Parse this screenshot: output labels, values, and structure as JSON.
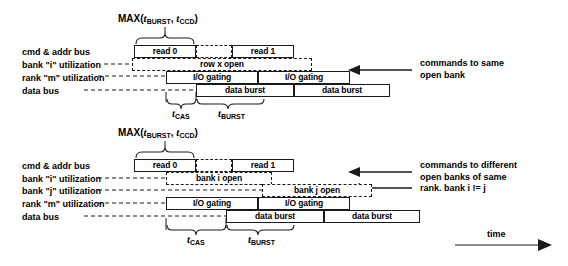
{
  "figure": {
    "title_note": "DRAM read command timing diagram",
    "time_axis_label": "time"
  },
  "diagram_top": {
    "max_label": {
      "fn": "MAX(",
      "t1": "t",
      "sub1": "BURST",
      "sep": ", ",
      "t2": "t",
      "sub2": "CCD",
      "close": ")"
    },
    "row_labels": [
      "cmd & addr bus",
      "bank \"i\" utilization",
      "rank \"m\" utilization",
      "data bus"
    ],
    "boxes": {
      "read0": "read 0",
      "read1": "read 1",
      "row_open": "row x open",
      "io_gating_1": "I/O gating",
      "io_gating_2": "I/O gating",
      "data_burst_1": "data burst",
      "data_burst_2": "data burst"
    },
    "measures": [
      {
        "name": "t",
        "sub": "CAS"
      },
      {
        "name": "t",
        "sub": "BURST"
      }
    ],
    "annotation": [
      "commands to same",
      "open bank"
    ]
  },
  "diagram_bottom": {
    "max_label": {
      "fn": "MAX(",
      "t1": "t",
      "sub1": "BURST",
      "sep": ", ",
      "t2": "t",
      "sub2": "CCD",
      "close": ")"
    },
    "row_labels": [
      "cmd & addr bus",
      "bank \"i\" utilization",
      "bank \"j\" utilization",
      "rank \"m\" utilization",
      "data bus"
    ],
    "boxes": {
      "read0": "read 0",
      "read1": "read 1",
      "bank_i_open": "bank i open",
      "bank_j_open": "bank j open",
      "io_gating_1": "I/O gating",
      "io_gating_2": "I/O gating",
      "data_burst_1": "data burst",
      "data_burst_2": "data burst"
    },
    "measures": [
      {
        "name": "t",
        "sub": "CAS"
      },
      {
        "name": "t",
        "sub": "BURST"
      }
    ],
    "annotation": [
      "commands to different",
      "open banks of same",
      "rank. bank i != j"
    ]
  },
  "colors": {
    "stroke": "#1a1a1a",
    "background": "#ffffff",
    "text": "#000000"
  }
}
